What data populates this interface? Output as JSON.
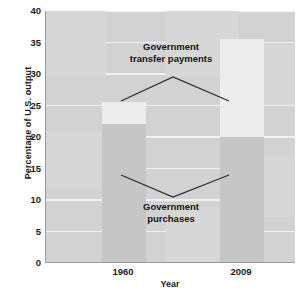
{
  "chart_data": {
    "type": "bar",
    "title": "",
    "subtitle": "",
    "xlabel": "Year",
    "ylabel": "Percentage of U.S. output",
    "categories": [
      "1960",
      "2009"
    ],
    "series": [
      {
        "name": "Government purchases",
        "values": [
          22,
          20
        ]
      },
      {
        "name": "Government transfer payments",
        "values": [
          3.5,
          15.5
        ]
      }
    ],
    "stacked": true,
    "ylim": [
      0,
      40
    ],
    "yticks": [
      "0",
      "5",
      "10",
      "15",
      "20",
      "25",
      "30",
      "35",
      "40"
    ],
    "ytick_values": [
      0,
      5,
      10,
      15,
      20,
      25,
      30,
      35,
      40
    ],
    "xticks": [
      "1960",
      "2009"
    ],
    "grid": true,
    "legend": "none",
    "annotations": [
      {
        "label_line1": "Government",
        "label_line2": "transfer payments",
        "points_to": "upper light segments of both bars"
      },
      {
        "label_line1": "Government",
        "label_line2": "purchases",
        "points_to": "lower dark segments of both bars"
      }
    ],
    "colors": {
      "panel": "#d2d2d2",
      "gridline": "#f2f2f2",
      "purchases": "#c6c6c6",
      "transfers": "#ececec",
      "axis": "#9a9a9a",
      "text": "#121212"
    }
  },
  "axis": {
    "y_title": "Percentage of U.S. output",
    "x_title": "Year"
  },
  "annotations": {
    "transfers": {
      "line1": "Government",
      "line2": "transfer payments"
    },
    "purchases": {
      "line1": "Government",
      "line2": "purchases"
    }
  }
}
